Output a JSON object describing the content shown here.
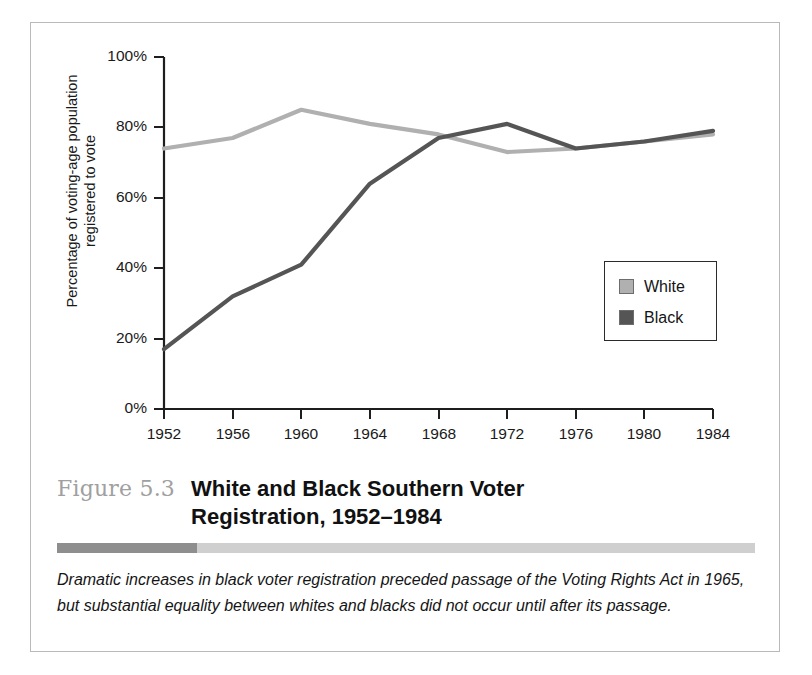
{
  "figure": {
    "number": "Figure 5.3",
    "title": "White and Black Southern Voter Registration, 1952–1984",
    "caption": "Dramatic increases in black voter registration preceded passage of the Voting Rights Act in 1965, but substantial equality between whites and blacks did not occur until after its passage."
  },
  "legend": {
    "position": "inside-right",
    "items": [
      {
        "label": "White",
        "color": "#b0b0b0"
      },
      {
        "label": "Black",
        "color": "#555555"
      }
    ]
  },
  "axes": {
    "y_title_line1": "Percentage of voting-age population",
    "y_title_line2": "registered to vote",
    "y_ticks": [
      "0%",
      "20%",
      "40%",
      "60%",
      "80%",
      "100%"
    ],
    "x_ticks": [
      "1952",
      "1956",
      "1960",
      "1964",
      "1968",
      "1972",
      "1976",
      "1980",
      "1984"
    ]
  },
  "chart_data": {
    "type": "line",
    "title": "White and Black Southern Voter Registration, 1952–1984",
    "xlabel": "",
    "ylabel": "Percentage of voting-age population registered to vote",
    "categories": [
      1952,
      1956,
      1960,
      1964,
      1968,
      1972,
      1976,
      1980,
      1984
    ],
    "x": [
      1952,
      1956,
      1960,
      1964,
      1968,
      1972,
      1976,
      1980,
      1984
    ],
    "series": [
      {
        "name": "White",
        "color": "#b0b0b0",
        "values": [
          74,
          77,
          85,
          81,
          78,
          73,
          74,
          76,
          78
        ]
      },
      {
        "name": "Black",
        "color": "#555555",
        "values": [
          17,
          32,
          41,
          64,
          77,
          81,
          74,
          76,
          79
        ]
      }
    ],
    "ylim": [
      0,
      100
    ],
    "ytick_values": [
      0,
      20,
      40,
      60,
      80,
      100
    ],
    "grid": false,
    "legend_position": "inside-right"
  }
}
